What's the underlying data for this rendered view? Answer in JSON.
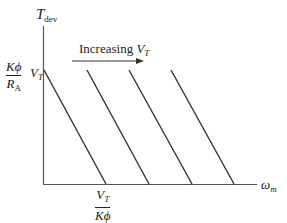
{
  "diagram": {
    "y_axis": {
      "symbol": "T",
      "subscript": "dev"
    },
    "x_axis": {
      "symbol": "ω",
      "subscript": "m"
    },
    "y_intercept_label": {
      "numerator": "Kϕ",
      "denominator": "R",
      "denominator_sub": "A",
      "suffix": "V",
      "suffix_sub": "T"
    },
    "x_intercept_label": {
      "numerator": "V",
      "numerator_sub": "T",
      "denominator": "Kϕ"
    },
    "annotation": {
      "text": "Increasing ",
      "symbol": "V",
      "subscript": "T"
    },
    "line_color": "#333333",
    "lines": [
      {
        "x1": 44,
        "y1": 70,
        "x2": 106,
        "y2": 184
      },
      {
        "x1": 87,
        "y1": 70,
        "x2": 149,
        "y2": 184
      },
      {
        "x1": 129,
        "y1": 70,
        "x2": 192,
        "y2": 184
      },
      {
        "x1": 171,
        "y1": 70,
        "x2": 234,
        "y2": 184
      }
    ]
  }
}
